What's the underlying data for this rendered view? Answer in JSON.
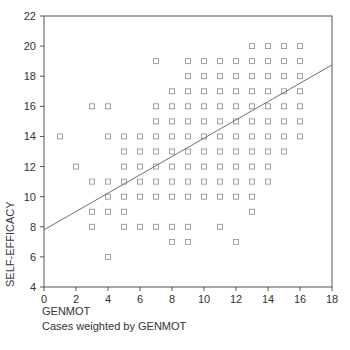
{
  "chart_data": {
    "type": "scatter",
    "title": "",
    "xlabel": "GENMOT",
    "ylabel": "SELF-EFFICACY",
    "note": "Cases weighted by GENMOT",
    "xlim": [
      0,
      18
    ],
    "ylim": [
      4,
      22
    ],
    "xticks": [
      0,
      2,
      4,
      6,
      8,
      10,
      12,
      14,
      16,
      18
    ],
    "yticks": [
      4,
      6,
      8,
      10,
      12,
      14,
      16,
      18,
      20,
      22
    ],
    "grid": false,
    "marker": "open-square",
    "points": [
      [
        1,
        14
      ],
      [
        2,
        12
      ],
      [
        3,
        16
      ],
      [
        3,
        11
      ],
      [
        3,
        9
      ],
      [
        3,
        8
      ],
      [
        4,
        16
      ],
      [
        4,
        14
      ],
      [
        4,
        11
      ],
      [
        4,
        10
      ],
      [
        4,
        9
      ],
      [
        4,
        6
      ],
      [
        5,
        14
      ],
      [
        5,
        13
      ],
      [
        5,
        12
      ],
      [
        5,
        11
      ],
      [
        5,
        10
      ],
      [
        5,
        9
      ],
      [
        5,
        8
      ],
      [
        6,
        14
      ],
      [
        6,
        13
      ],
      [
        6,
        12
      ],
      [
        6,
        11
      ],
      [
        6,
        10
      ],
      [
        6,
        8
      ],
      [
        7,
        19
      ],
      [
        7,
        16
      ],
      [
        7,
        15
      ],
      [
        7,
        14
      ],
      [
        7,
        13
      ],
      [
        7,
        12
      ],
      [
        7,
        11
      ],
      [
        7,
        10
      ],
      [
        7,
        8
      ],
      [
        8,
        17
      ],
      [
        8,
        16
      ],
      [
        8,
        15
      ],
      [
        8,
        14
      ],
      [
        8,
        13
      ],
      [
        8,
        12
      ],
      [
        8,
        11
      ],
      [
        8,
        10
      ],
      [
        8,
        8
      ],
      [
        8,
        7
      ],
      [
        9,
        19
      ],
      [
        9,
        18
      ],
      [
        9,
        17
      ],
      [
        9,
        16
      ],
      [
        9,
        15
      ],
      [
        9,
        14
      ],
      [
        9,
        13
      ],
      [
        9,
        12
      ],
      [
        9,
        11
      ],
      [
        9,
        10
      ],
      [
        9,
        8
      ],
      [
        9,
        7
      ],
      [
        10,
        19
      ],
      [
        10,
        18
      ],
      [
        10,
        17
      ],
      [
        10,
        16
      ],
      [
        10,
        15
      ],
      [
        10,
        14
      ],
      [
        10,
        13
      ],
      [
        10,
        12
      ],
      [
        10,
        11
      ],
      [
        10,
        10
      ],
      [
        11,
        19
      ],
      [
        11,
        18
      ],
      [
        11,
        17
      ],
      [
        11,
        16
      ],
      [
        11,
        15
      ],
      [
        11,
        14
      ],
      [
        11,
        13
      ],
      [
        11,
        12
      ],
      [
        11,
        11
      ],
      [
        11,
        10
      ],
      [
        11,
        8
      ],
      [
        12,
        19
      ],
      [
        12,
        18
      ],
      [
        12,
        17
      ],
      [
        12,
        16
      ],
      [
        12,
        15
      ],
      [
        12,
        14
      ],
      [
        12,
        13
      ],
      [
        12,
        12
      ],
      [
        12,
        11
      ],
      [
        12,
        10
      ],
      [
        12,
        7
      ],
      [
        13,
        20
      ],
      [
        13,
        19
      ],
      [
        13,
        18
      ],
      [
        13,
        17
      ],
      [
        13,
        16
      ],
      [
        13,
        15
      ],
      [
        13,
        14
      ],
      [
        13,
        13
      ],
      [
        13,
        12
      ],
      [
        13,
        11
      ],
      [
        13,
        10
      ],
      [
        13,
        9
      ],
      [
        14,
        20
      ],
      [
        14,
        19
      ],
      [
        14,
        18
      ],
      [
        14,
        17
      ],
      [
        14,
        16
      ],
      [
        14,
        15
      ],
      [
        14,
        14
      ],
      [
        14,
        13
      ],
      [
        14,
        12
      ],
      [
        14,
        11
      ],
      [
        15,
        20
      ],
      [
        15,
        19
      ],
      [
        15,
        18
      ],
      [
        15,
        17
      ],
      [
        15,
        16
      ],
      [
        15,
        15
      ],
      [
        15,
        14
      ],
      [
        15,
        13
      ],
      [
        16,
        20
      ],
      [
        16,
        19
      ],
      [
        16,
        18
      ],
      [
        16,
        17
      ],
      [
        16,
        16
      ],
      [
        16,
        15
      ],
      [
        16,
        14
      ]
    ],
    "regression_line": {
      "x": [
        0,
        18
      ],
      "y": [
        7.8,
        18.75
      ]
    },
    "colors": {
      "marker": "#8a8a8a",
      "line": "#6e6e6e",
      "axis": "#555555",
      "text": "#333333"
    }
  }
}
